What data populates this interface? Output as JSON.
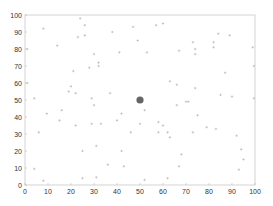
{
  "chart_data": {
    "type": "scatter",
    "title": "",
    "xlabel": "",
    "ylabel": "",
    "xlim": [
      0,
      100
    ],
    "ylim": [
      0,
      100
    ],
    "grid": false,
    "legend": null,
    "xticks": [
      0,
      10,
      20,
      30,
      40,
      50,
      60,
      70,
      80,
      90,
      100
    ],
    "yticks": [
      0,
      10,
      20,
      30,
      40,
      50,
      60,
      70,
      80,
      90,
      100
    ],
    "series": [
      {
        "name": "background points",
        "marker": "small-plus",
        "color": "#b8b8b8",
        "points": [
          [
            8,
            92
          ],
          [
            14,
            82
          ],
          [
            24,
            98
          ],
          [
            26,
            94
          ],
          [
            23,
            87
          ],
          [
            26,
            88
          ],
          [
            30,
            77
          ],
          [
            32,
            72
          ],
          [
            32,
            70
          ],
          [
            28,
            69
          ],
          [
            21,
            67
          ],
          [
            20,
            58
          ],
          [
            19,
            55
          ],
          [
            22,
            54
          ],
          [
            29,
            51
          ],
          [
            4,
            51
          ],
          [
            1,
            80
          ],
          [
            1,
            60
          ],
          [
            37,
            54
          ],
          [
            38,
            90
          ],
          [
            41,
            78
          ],
          [
            47,
            93
          ],
          [
            49,
            85
          ],
          [
            53,
            78
          ],
          [
            57,
            94
          ],
          [
            60,
            95
          ],
          [
            67,
            79
          ],
          [
            73,
            84
          ],
          [
            74,
            80
          ],
          [
            74,
            77
          ],
          [
            82,
            84
          ],
          [
            82,
            81
          ],
          [
            84,
            89
          ],
          [
            89,
            88
          ],
          [
            99,
            81
          ],
          [
            99.5,
            70
          ],
          [
            87,
            66
          ],
          [
            66,
            59
          ],
          [
            74,
            57
          ],
          [
            63,
            61
          ],
          [
            85,
            53
          ],
          [
            90,
            52
          ],
          [
            70,
            49
          ],
          [
            99.5,
            51
          ],
          [
            16,
            44
          ],
          [
            9.5,
            42
          ],
          [
            15,
            38
          ],
          [
            22,
            35
          ],
          [
            29,
            36
          ],
          [
            33,
            36
          ],
          [
            40,
            38
          ],
          [
            42,
            42
          ],
          [
            6,
            31
          ],
          [
            46,
            31
          ],
          [
            30,
            47
          ],
          [
            25,
            20
          ],
          [
            31,
            23
          ],
          [
            42,
            20
          ],
          [
            36,
            12
          ],
          [
            43,
            11
          ],
          [
            4,
            9.5
          ],
          [
            8,
            2.5
          ],
          [
            25,
            4
          ],
          [
            31,
            4.5
          ],
          [
            66,
            47
          ],
          [
            71,
            49
          ],
          [
            75,
            41
          ],
          [
            52,
            44
          ],
          [
            50,
            36
          ],
          [
            58,
            37
          ],
          [
            60,
            35
          ],
          [
            58,
            31
          ],
          [
            62,
            31
          ],
          [
            63,
            28
          ],
          [
            73,
            31
          ],
          [
            79,
            34
          ],
          [
            83,
            33
          ],
          [
            92,
            29
          ],
          [
            94,
            21
          ],
          [
            95,
            15
          ],
          [
            68,
            18
          ],
          [
            67,
            11
          ],
          [
            93,
            9
          ],
          [
            62,
            4
          ],
          [
            52,
            3
          ]
        ]
      },
      {
        "name": "highlighted point",
        "marker": "large-circle",
        "color": "#666666",
        "points": [
          [
            50,
            50
          ]
        ]
      }
    ]
  },
  "axes": {
    "x_tick_labels": [
      "0",
      "10",
      "20",
      "30",
      "40",
      "50",
      "60",
      "70",
      "80",
      "90",
      "100"
    ],
    "y_tick_labels": [
      "0",
      "10",
      "20",
      "30",
      "40",
      "50",
      "60",
      "70",
      "80",
      "90",
      "100"
    ]
  },
  "colors": {
    "axis": "#bbbbbb",
    "tick_text": "#333333",
    "point": "#b8b8b8",
    "highlight": "#666666"
  }
}
